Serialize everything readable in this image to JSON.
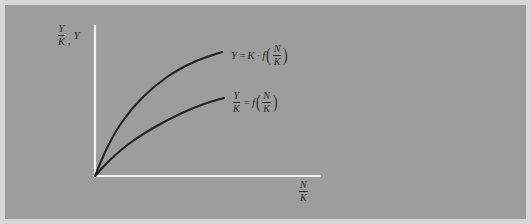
{
  "figure": {
    "background_color": "#9d9d9d",
    "outer_color": "#d8d8d8",
    "axis_color": "#f2f2f2",
    "curve_color": "#232323",
    "ink_color": "#2b2b2b"
  },
  "axes": {
    "y_axis": {
      "label_parts": {
        "fraction_numerator": "Y",
        "fraction_denominator": "K",
        "separator": ",",
        "second_term": "Y"
      },
      "label_text": "Y/K, Y"
    },
    "x_axis": {
      "label_parts": {
        "fraction_numerator": "N",
        "fraction_denominator": "K"
      },
      "label_text": "N/K"
    }
  },
  "curves": {
    "upper": {
      "label_text": "Y = K·f(N/K)",
      "parts": {
        "lhs": "Y",
        "equals": "=",
        "coefficient": "K",
        "dot": "·",
        "function": "f",
        "open_paren": "(",
        "arg_numerator": "N",
        "arg_denominator": "K",
        "close_paren": ")"
      }
    },
    "lower": {
      "label_text": "Y/K = f(N/K)",
      "parts": {
        "lhs_numerator": "Y",
        "lhs_denominator": "K",
        "equals": "=",
        "function": "f",
        "open_paren": "(",
        "arg_numerator": "N",
        "arg_denominator": "K",
        "close_paren": ")"
      }
    }
  },
  "chart_data": {
    "type": "line",
    "title": "",
    "xlabel": "N/K",
    "ylabel": "Y/K, Y",
    "grid": false,
    "legend": "inline-curve-labels",
    "axis_origin_px": [
      95,
      176
    ],
    "x_axis_end_px": [
      320,
      176
    ],
    "y_axis_top_px": [
      95,
      26
    ],
    "series": [
      {
        "name": "Y = K·f(N/K)",
        "points_px": [
          [
            95,
            176
          ],
          [
            107,
            148
          ],
          [
            122,
            122
          ],
          [
            142,
            98
          ],
          [
            167,
            77
          ],
          [
            194,
            62
          ],
          [
            222,
            52
          ]
        ]
      },
      {
        "name": "Y/K = f(N/K)",
        "points_px": [
          [
            95,
            176
          ],
          [
            110,
            160
          ],
          [
            130,
            143
          ],
          [
            155,
            127
          ],
          [
            182,
            113
          ],
          [
            204,
            104
          ],
          [
            224,
            98
          ]
        ]
      }
    ]
  }
}
